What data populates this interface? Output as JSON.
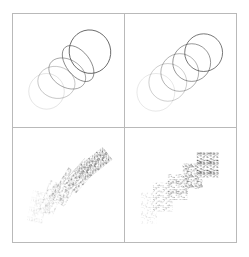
{
  "figure": {
    "background_color": "#ffffff",
    "border_color": "#b9b9b9",
    "grid_rows": 2,
    "grid_cols": 2,
    "steps_per_panel": 5
  },
  "panels": [
    {
      "id": "panel-top-left",
      "position": "top-left",
      "label": "",
      "shape_type": "ellipse-outline",
      "transform": "rotate-and-scale",
      "stroke_color": "#4a4a4a",
      "fill": "none",
      "stroke_width": 0.8,
      "shapes": [
        {
          "cx": 34,
          "cy": 78,
          "rx": 18,
          "ry": 18,
          "rotation": 0,
          "opacity": 0.18
        },
        {
          "cx": 44,
          "cy": 69,
          "rx": 19,
          "ry": 16,
          "rotation": 14,
          "opacity": 0.36
        },
        {
          "cx": 55,
          "cy": 60,
          "rx": 20,
          "ry": 14,
          "rotation": 30,
          "opacity": 0.55
        },
        {
          "cx": 66,
          "cy": 50,
          "rx": 21,
          "ry": 12,
          "rotation": 52,
          "opacity": 0.74
        },
        {
          "cx": 78,
          "cy": 38,
          "rx": 22,
          "ry": 21,
          "rotation": 74,
          "opacity": 0.95
        }
      ]
    },
    {
      "id": "panel-top-right",
      "position": "top-right",
      "label": "",
      "shape_type": "circle-outline",
      "transform": "translate-only",
      "stroke_color": "#4a4a4a",
      "fill": "none",
      "stroke_width": 0.8,
      "shapes": [
        {
          "cx": 31,
          "cy": 79,
          "rx": 19,
          "ry": 19,
          "rotation": 0,
          "opacity": 0.16
        },
        {
          "cx": 43,
          "cy": 69,
          "rx": 19,
          "ry": 19,
          "rotation": 0,
          "opacity": 0.34
        },
        {
          "cx": 55,
          "cy": 59,
          "rx": 19,
          "ry": 19,
          "rotation": 0,
          "opacity": 0.53
        },
        {
          "cx": 67,
          "cy": 49,
          "rx": 19,
          "ry": 19,
          "rotation": 0,
          "opacity": 0.73
        },
        {
          "cx": 79,
          "cy": 39,
          "rx": 19,
          "ry": 19,
          "rotation": 0,
          "opacity": 0.95
        }
      ]
    },
    {
      "id": "panel-bottom-left",
      "position": "bottom-left",
      "label": "",
      "shape_type": "noise-rectangle",
      "transform": "rotate-and-translate",
      "fill_color": "#3a3a3a",
      "texture": "random-noise",
      "shapes": [
        {
          "cx": 25,
          "cy": 79,
          "w": 16,
          "h": 31,
          "rotation": 12,
          "opacity": 0.2
        },
        {
          "cx": 39,
          "cy": 70,
          "w": 16,
          "h": 33,
          "rotation": 22,
          "opacity": 0.42
        },
        {
          "cx": 54,
          "cy": 59,
          "w": 17,
          "h": 36,
          "rotation": 32,
          "opacity": 0.62
        },
        {
          "cx": 68,
          "cy": 48,
          "w": 17,
          "h": 33,
          "rotation": 42,
          "opacity": 0.8
        },
        {
          "cx": 82,
          "cy": 36,
          "w": 16,
          "h": 35,
          "rotation": 52,
          "opacity": 0.96
        }
      ]
    },
    {
      "id": "panel-bottom-right",
      "position": "bottom-right",
      "label": "",
      "shape_type": "noise-rectangle",
      "transform": "translate-only",
      "fill_color": "#3a3a3a",
      "texture": "random-noise",
      "shapes": [
        {
          "cx": 24,
          "cy": 80,
          "w": 16,
          "h": 31,
          "rotation": 0,
          "opacity": 0.2
        },
        {
          "cx": 38,
          "cy": 69,
          "w": 20,
          "h": 29,
          "rotation": 0,
          "opacity": 0.43
        },
        {
          "cx": 53,
          "cy": 59,
          "w": 20,
          "h": 26,
          "rotation": 0,
          "opacity": 0.63
        },
        {
          "cx": 68,
          "cy": 48,
          "w": 20,
          "h": 25,
          "rotation": 0,
          "opacity": 0.81
        },
        {
          "cx": 83,
          "cy": 37,
          "w": 22,
          "h": 25,
          "rotation": 0,
          "opacity": 0.97
        }
      ]
    }
  ]
}
